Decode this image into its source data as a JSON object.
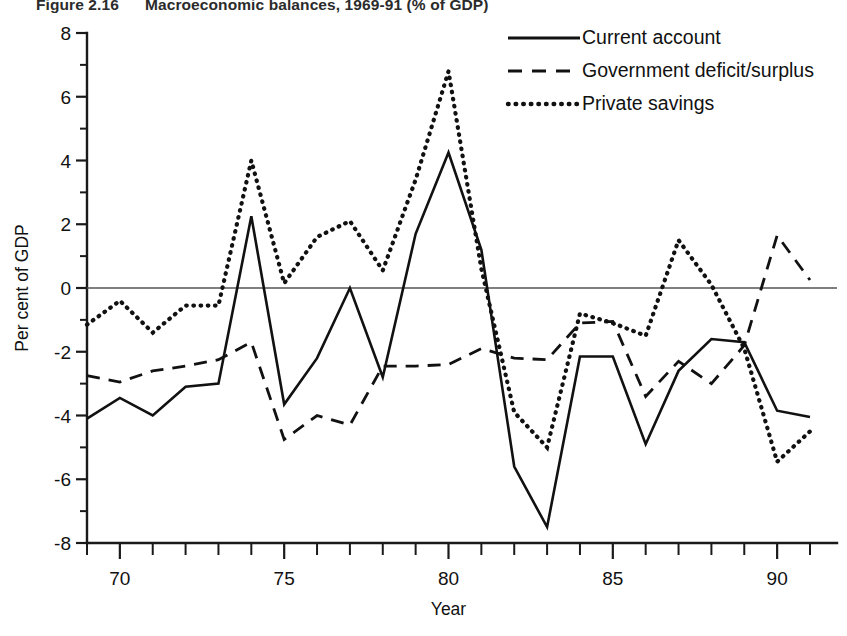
{
  "figure": {
    "number": "Figure 2.16",
    "caption": "Macroeconomic balances, 1969-91 (% of GDP)"
  },
  "chart_data": {
    "type": "line",
    "title": "Macroeconomic balances, 1969-91 (% of GDP)",
    "xlabel": "Year",
    "ylabel": "Per cent of GDP",
    "xlim": [
      1969,
      1991
    ],
    "ylim": [
      -8,
      8
    ],
    "yticks": [
      8,
      6,
      4,
      2,
      0,
      -2,
      -4,
      -6,
      -8
    ],
    "ytick_labels": [
      "8",
      "6",
      "4",
      "2",
      "0",
      "-2",
      "-4",
      "-6",
      "-8"
    ],
    "yminor_step": 1,
    "xticks": [
      1970,
      1975,
      1980,
      1985,
      1990
    ],
    "xtick_labels": [
      "70",
      "75",
      "80",
      "85",
      "90"
    ],
    "xminor_step": 1,
    "grid": false,
    "zero_line": true,
    "legend_position": "top-right",
    "x": [
      1969,
      1970,
      1971,
      1972,
      1973,
      1974,
      1975,
      1976,
      1977,
      1978,
      1979,
      1980,
      1981,
      1982,
      1983,
      1984,
      1985,
      1986,
      1987,
      1988,
      1989,
      1990,
      1991
    ],
    "series": [
      {
        "name": "Current account",
        "style": "solid",
        "values": [
          -4.1,
          -3.45,
          -4.0,
          -3.1,
          -3.0,
          2.25,
          -3.65,
          -2.2,
          0.0,
          -2.8,
          1.7,
          4.25,
          1.2,
          -5.6,
          -7.5,
          -2.15,
          -2.15,
          -4.9,
          -2.6,
          -1.6,
          -1.7,
          -3.85,
          -4.05
        ]
      },
      {
        "name": "Government deficit/surplus",
        "style": "dashed",
        "values": [
          -2.75,
          -2.95,
          -2.6,
          -2.45,
          -2.25,
          -1.7,
          -4.75,
          -4.0,
          -4.3,
          -2.45,
          -2.45,
          -2.4,
          -1.9,
          -2.2,
          -2.25,
          -1.1,
          -1.05,
          -3.4,
          -2.3,
          -3.0,
          -1.8,
          1.65,
          0.25
        ]
      },
      {
        "name": "Private savings",
        "style": "dotted",
        "values": [
          -1.15,
          -0.4,
          -1.4,
          -0.55,
          -0.55,
          4.0,
          0.15,
          1.6,
          2.1,
          0.55,
          3.4,
          6.8,
          0.6,
          -3.9,
          -5.0,
          -0.8,
          -1.1,
          -1.5,
          1.5,
          0.1,
          -1.9,
          -5.45,
          -4.5
        ]
      }
    ]
  },
  "legend": {
    "items": [
      {
        "label": "Current account",
        "style": "solid"
      },
      {
        "label": "Government deficit/surplus",
        "style": "dashed"
      },
      {
        "label": "Private savings",
        "style": "dotted"
      }
    ]
  }
}
